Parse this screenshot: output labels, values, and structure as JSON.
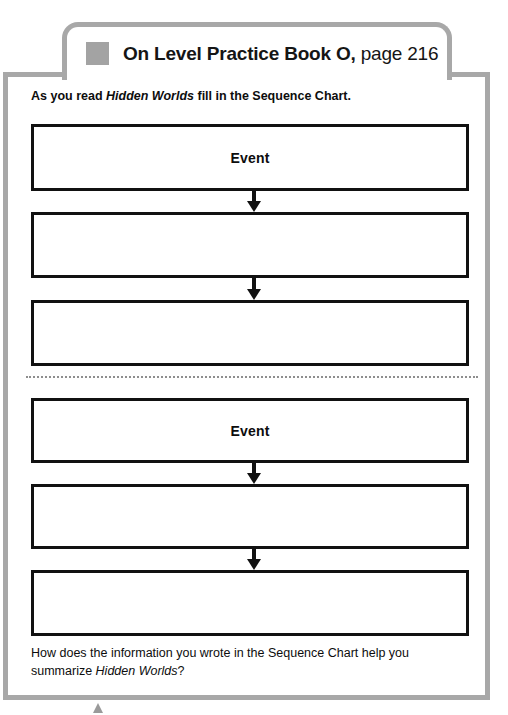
{
  "header": {
    "icon": "gray-square-marker",
    "title_bold": "On Level Practice Book O,",
    "title_regular": " page 216"
  },
  "worksheet": {
    "instruction_pre": "As you read ",
    "instruction_book": "Hidden Worlds",
    "instruction_post": " fill in the Sequence Chart.",
    "closing_pre": "How does the information you wrote in the Sequence Chart help you summarize ",
    "closing_book": "Hidden Worlds",
    "closing_post": "?"
  },
  "chart_data": {
    "type": "diagram",
    "title": "Sequence Chart",
    "sections": [
      {
        "name": "sequence-chart-top",
        "boxes": [
          {
            "label": "Event",
            "filled": true
          },
          {
            "label": "",
            "filled": false
          },
          {
            "label": "",
            "filled": false
          }
        ]
      },
      {
        "name": "sequence-chart-bottom",
        "boxes": [
          {
            "label": "Event",
            "filled": true
          },
          {
            "label": "",
            "filled": false
          },
          {
            "label": "",
            "filled": false
          }
        ]
      }
    ],
    "connectors": [
      "down-arrow",
      "down-arrow",
      "down-arrow",
      "down-arrow"
    ],
    "divider": "dotted-cut-line"
  },
  "colors": {
    "frame_border": "#a8a8a8",
    "box_border": "#111111",
    "icon_gray": "#a3a3a3",
    "text": "#0d0d0d",
    "page_background": "#ffffff"
  }
}
